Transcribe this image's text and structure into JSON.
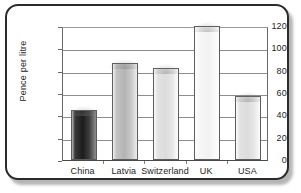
{
  "chart_data": {
    "type": "bar",
    "title": "",
    "xlabel": "",
    "ylabel": "Pence per litre",
    "categories": [
      "China",
      "Latvia",
      "Switzerland",
      "UK",
      "USA"
    ],
    "values": [
      45,
      87,
      82,
      120,
      57
    ],
    "ylim": [
      0,
      120
    ],
    "ytick_labels": [
      "0",
      "20",
      "40",
      "60",
      "80",
      "100",
      "120"
    ],
    "ytick_values": [
      0,
      20,
      40,
      60,
      80,
      100,
      120
    ],
    "grid": true,
    "legend": "none",
    "series": [
      {
        "name": "Pence per litre",
        "values": [
          45,
          87,
          82,
          120,
          57
        ]
      }
    ],
    "bar_styles": [
      "dark",
      "mid",
      "light",
      "pale",
      "light"
    ]
  },
  "colors": {
    "frame_border": "#2b2b2b",
    "axis": "#6a6a6a",
    "gridline": "#8d8d8d",
    "text": "#1d1d1d",
    "background": "#ffffff",
    "bar_outline": "#5d5d5d",
    "bar_dark": "#1c1c1c",
    "bar_mid": "#b4b4b4",
    "bar_light": "#dcdcdc",
    "bar_pale": "#f2f2f2"
  }
}
